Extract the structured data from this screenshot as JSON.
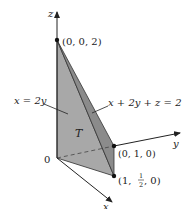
{
  "diagram": {
    "axes": {
      "x_label": "x",
      "y_label": "y",
      "z_label": "z",
      "origin_label": "0"
    },
    "points": {
      "top": "(0, 0, 2)",
      "y_point": "(0, 1, 0)",
      "x_point_prefix": "(1, ",
      "x_point_num": "1",
      "x_point_den": "2",
      "x_point_suffix": ", 0)"
    },
    "labels": {
      "plane_left": "x = 2y",
      "plane_right": "x + 2y + z = 2",
      "region": "T"
    },
    "colors": {
      "face_left": "#a9a9a9",
      "face_front": "#8a8a8a",
      "face_bottom": "#b8b8b8",
      "edge": "#333333"
    }
  }
}
